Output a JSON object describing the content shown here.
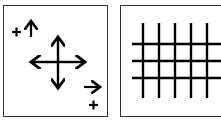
{
  "panels": [
    {
      "id": "left",
      "description": "move tool: four-way arrow with plus signs",
      "symbols": {
        "top_plus": "+",
        "top_arrow": "↑",
        "right_arrow": "→",
        "bottom_plus": "+"
      }
    },
    {
      "id": "right",
      "description": "grid of lines",
      "grid": {
        "vertical_lines": 5,
        "horizontal_lines": 3
      }
    }
  ],
  "colors": {
    "stroke": "#000000",
    "border": "#333333",
    "background": "#ffffff"
  }
}
